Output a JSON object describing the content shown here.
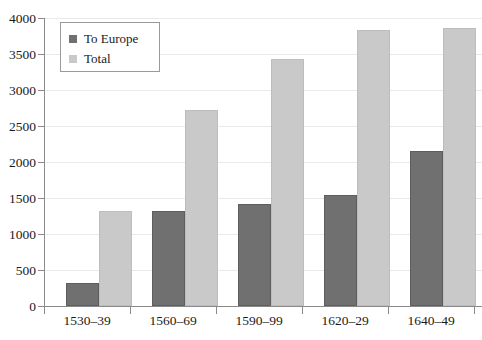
{
  "chart_data": {
    "type": "bar",
    "title": "",
    "xlabel": "",
    "ylabel": "",
    "ylim": [
      0,
      4000
    ],
    "ytick_step": 500,
    "yticks": [
      0,
      500,
      1000,
      1500,
      2000,
      2500,
      3000,
      3500,
      4000
    ],
    "ytick_labels": [
      "0",
      "500",
      "1000",
      "1500",
      "2000",
      "2500",
      "3000",
      "3500",
      "4000"
    ],
    "categories": [
      "1530–39",
      "1560–69",
      "1590–99",
      "1620–29",
      "1640–49"
    ],
    "series": [
      {
        "name": "To Europe",
        "color": "#707070",
        "values": [
          320,
          1320,
          1420,
          1540,
          2150
        ]
      },
      {
        "name": "Total",
        "color": "#c9c9c9",
        "values": [
          1320,
          2720,
          3430,
          3840,
          3860
        ]
      }
    ],
    "legend": {
      "position": "top-left-inside",
      "entries": [
        {
          "label": "To Europe",
          "swatch": "dark"
        },
        {
          "label": "Total",
          "swatch": "light"
        }
      ]
    },
    "grid": {
      "horizontal": true,
      "vertical": false,
      "color": "#e9e9e9"
    },
    "axes": {
      "left_spine": true,
      "bottom_spine": true,
      "top_spine": false,
      "right_spine": false,
      "axis_color": "#8a8a8a"
    },
    "background": "#ffffff"
  }
}
